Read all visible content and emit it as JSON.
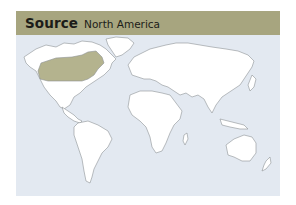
{
  "header": {
    "title": "Source",
    "subtitle": "North America"
  },
  "map": {
    "highlighted_region": "North America (USA/Canada east-central)",
    "colors": {
      "header_bg": "#a7a57f",
      "ocean": "#e3e9f1",
      "land": "#ffffff",
      "highlight": "#b4b38e",
      "outline": "#8d9296"
    }
  }
}
